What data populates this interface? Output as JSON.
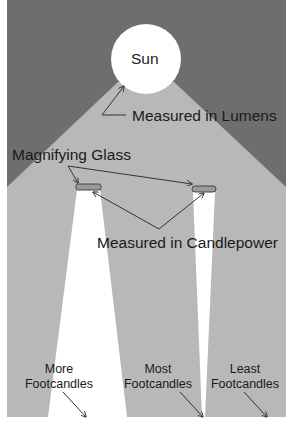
{
  "diagram": {
    "colors": {
      "background": "#ffffff",
      "sky": "#6e6e6e",
      "beam": "#b8b8b8",
      "sun": "#ffffff",
      "lens_fill": "#9a9a9a",
      "arrow": "#333333",
      "text": "#1a1a1a"
    },
    "sun": {
      "label": "Sun"
    },
    "labels": {
      "lumens": "Measured in Lumens",
      "magnifying_glass": "Magnifying Glass",
      "candlepower": "Measured in Candlepower"
    },
    "footcandles": [
      {
        "line1": "More",
        "line2": "Footcandles"
      },
      {
        "line1": "Most",
        "line2": "Footcandles"
      },
      {
        "line1": "Least",
        "line2": "Footcandles"
      }
    ],
    "caption": "Figure 1 (cut off)"
  }
}
